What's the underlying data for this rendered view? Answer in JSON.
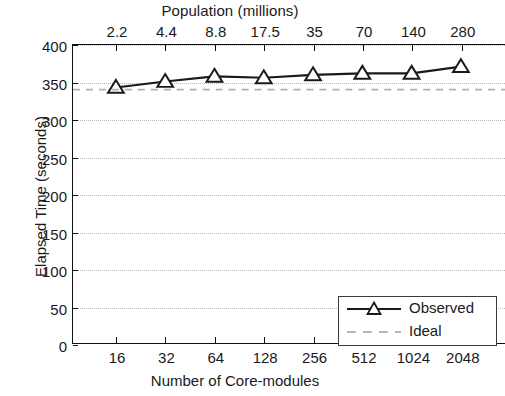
{
  "chart_data": {
    "type": "line",
    "title": "",
    "top_axis_label": "Population (millions)",
    "xlabel": "Number of Core-modules",
    "ylabel": "Elapsed Time (seconds)",
    "categories": [
      "16",
      "32",
      "64",
      "128",
      "256",
      "512",
      "1024",
      "2048"
    ],
    "top_tick_labels": [
      "2.2",
      "4.4",
      "8.8",
      "17.5",
      "35",
      "70",
      "140",
      "280"
    ],
    "ylim": [
      0,
      400
    ],
    "yticks": [
      0,
      50,
      100,
      150,
      200,
      250,
      300,
      350,
      400
    ],
    "ytick_labels": [
      "0",
      "50",
      "100",
      "150",
      "200",
      "250",
      "300",
      "350",
      "400"
    ],
    "grid": true,
    "legend_position": "bottom-right",
    "series": [
      {
        "name": "Observed",
        "style": "solid-line-with-triangle-markers",
        "color": "#1a1a1a",
        "values": [
          343,
          351,
          358,
          356,
          360,
          362,
          362,
          371
        ]
      },
      {
        "name": "Ideal",
        "style": "dashed-line",
        "color": "#b0b0b0",
        "values": [
          340,
          340,
          340,
          340,
          340,
          340,
          340,
          340
        ]
      }
    ]
  },
  "legend": {
    "entries": [
      {
        "label": "Observed"
      },
      {
        "label": "Ideal"
      }
    ]
  }
}
